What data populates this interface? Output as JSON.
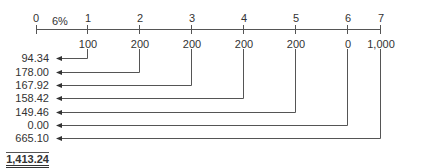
{
  "timeline": {
    "rate_label": "6%",
    "periods": [
      "0",
      "1",
      "2",
      "3",
      "4",
      "5",
      "6",
      "7"
    ],
    "cash_flows": [
      "",
      "100",
      "200",
      "200",
      "200",
      "200",
      "0",
      "1,000"
    ]
  },
  "present_values": [
    "94.34",
    "178.00",
    "167.92",
    "158.42",
    "149.46",
    "0.00",
    "665.10"
  ],
  "total": "1,413.24",
  "colors": {
    "line": "#555555",
    "text": "#333333"
  }
}
